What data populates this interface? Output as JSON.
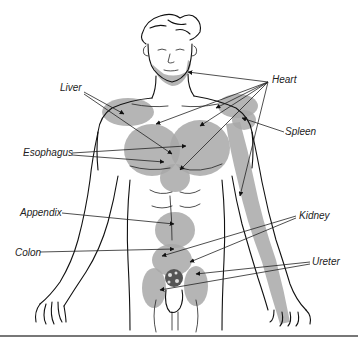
{
  "colors": {
    "zone_fill": "#a8a8a8",
    "line": "#111111",
    "background": "#ffffff",
    "separator": "#777777"
  },
  "labels": {
    "liver": "Liver",
    "heart": "Heart",
    "esophagus": "Esophagus",
    "spleen": "Spleen",
    "appendix": "Appendix",
    "colon": "Colon",
    "kidney": "Kidney",
    "ureter": "Ureter"
  },
  "organs": [
    {
      "id": "liver",
      "label": "Liver",
      "zones": [
        "right shoulder",
        "right upper chest"
      ]
    },
    {
      "id": "heart",
      "label": "Heart",
      "zones": [
        "jaw",
        "left shoulder",
        "chest",
        "left arm"
      ]
    },
    {
      "id": "esophagus",
      "label": "Esophagus",
      "zones": [
        "sternum",
        "epigastrium"
      ]
    },
    {
      "id": "spleen",
      "label": "Spleen",
      "zones": [
        "left shoulder"
      ]
    },
    {
      "id": "appendix",
      "label": "Appendix",
      "zones": [
        "periumbilical"
      ]
    },
    {
      "id": "colon",
      "label": "Colon",
      "zones": [
        "lower abdomen"
      ]
    },
    {
      "id": "kidney",
      "label": "Kidney",
      "zones": [
        "lower abdomen",
        "groin"
      ]
    },
    {
      "id": "ureter",
      "label": "Ureter",
      "zones": [
        "groin",
        "genitals"
      ]
    }
  ]
}
